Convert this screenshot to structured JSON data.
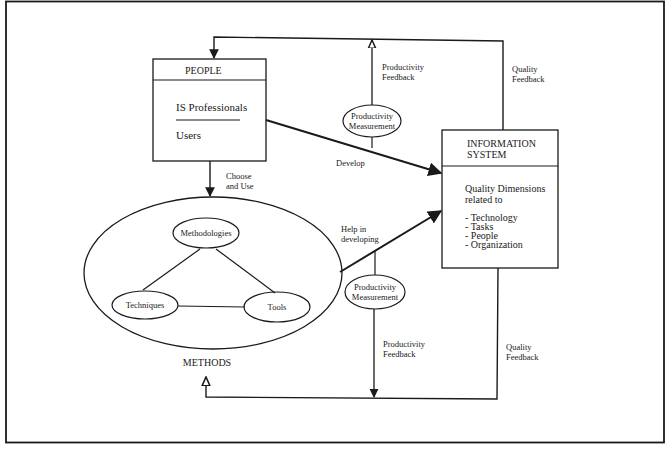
{
  "diagram": {
    "people_box": {
      "title": "PEOPLE",
      "items": [
        "IS Professionals",
        "Users"
      ]
    },
    "information_system_box": {
      "title_line1": "INFORMATION",
      "title_line2": "SYSTEM",
      "subtitle_line1": "Quality Dimensions",
      "subtitle_line2": "related to",
      "dimensions": [
        "- Technology",
        "- Tasks",
        "- People",
        "- Organization"
      ]
    },
    "methods": {
      "label": "METHODS",
      "components": [
        "Methodologies",
        "Techniques",
        "Tools"
      ]
    },
    "productivity_measurement_top": {
      "line1": "Productivity",
      "line2": "Measurement"
    },
    "productivity_measurement_bottom": {
      "line1": "Productivity",
      "line2": "Measurement"
    },
    "edge_labels": {
      "choose_and_use_line1": "Choose",
      "choose_and_use_line2": "and Use",
      "develop": "Develop",
      "help_in_developing_line1": "Help in",
      "help_in_developing_line2": "developing",
      "productivity_feedback_top_line1": "Productivity",
      "productivity_feedback_top_line2": "Feedback",
      "quality_feedback_top_line1": "Quality",
      "quality_feedback_top_line2": "Feedback",
      "productivity_feedback_bottom_line1": "Productivity",
      "productivity_feedback_bottom_line2": "Feedback",
      "quality_feedback_bottom_line1": "Quality",
      "quality_feedback_bottom_line2": "Feedback"
    },
    "colors": {
      "ink": "#1a1a1a",
      "paper": "#ffffff"
    }
  }
}
